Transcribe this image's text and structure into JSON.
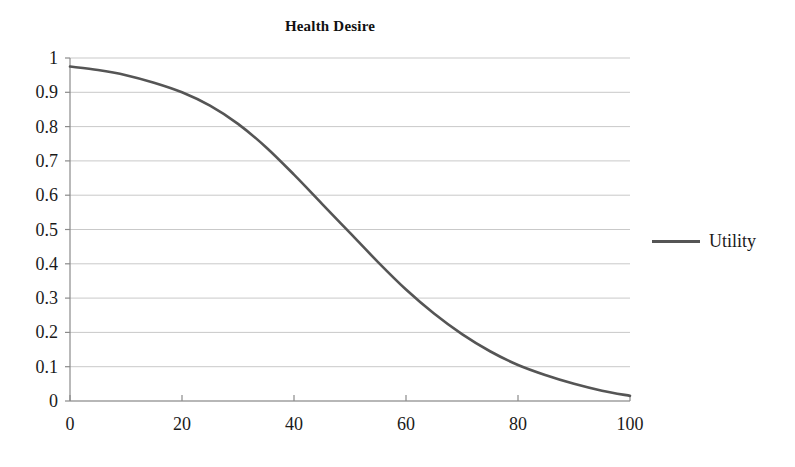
{
  "chart_data": {
    "type": "line",
    "title": "Health Desire",
    "xlabel": "",
    "ylabel": "",
    "xlim": [
      0,
      100
    ],
    "ylim": [
      0,
      1
    ],
    "grid": true,
    "legend_position": "right",
    "x_ticks": [
      "0",
      "20",
      "40",
      "60",
      "80",
      "100"
    ],
    "x_tick_values": [
      0,
      20,
      40,
      60,
      80,
      100
    ],
    "y_ticks": [
      "0",
      "0.1",
      "0.2",
      "0.3",
      "0.4",
      "0.5",
      "0.6",
      "0.7",
      "0.8",
      "0.9",
      "1"
    ],
    "y_tick_values": [
      0,
      0.1,
      0.2,
      0.3,
      0.4,
      0.5,
      0.6,
      0.7,
      0.8,
      0.9,
      1
    ],
    "series": [
      {
        "name": "Utility",
        "color": "#555555",
        "x": [
          0,
          5,
          10,
          15,
          20,
          25,
          30,
          35,
          40,
          45,
          50,
          55,
          60,
          65,
          70,
          75,
          80,
          85,
          90,
          95,
          100
        ],
        "values": [
          0.975,
          0.965,
          0.95,
          0.928,
          0.9,
          0.861,
          0.808,
          0.74,
          0.66,
          0.575,
          0.49,
          0.405,
          0.325,
          0.255,
          0.195,
          0.145,
          0.105,
          0.075,
          0.05,
          0.03,
          0.015
        ]
      }
    ],
    "legend": [
      "Utility"
    ]
  },
  "legend": {
    "swatch_icon": "line-swatch-icon",
    "label": "Utility"
  }
}
